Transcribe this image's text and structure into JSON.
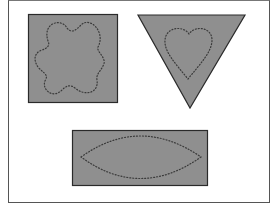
{
  "figure": {
    "colors": {
      "fill": "#8f8f8f",
      "outline": "#2a2a2a",
      "dotted": "#3a3a3a",
      "background": "#ffffff"
    },
    "shapes": [
      {
        "name": "square",
        "inner_shape": "flower"
      },
      {
        "name": "inverted-triangle",
        "inner_shape": "heart"
      },
      {
        "name": "rectangle",
        "inner_shape": "lens"
      }
    ]
  }
}
